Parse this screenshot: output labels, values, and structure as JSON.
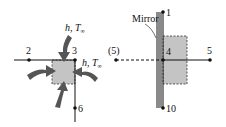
{
  "left_diagram": {
    "convection_top": {
      "h": "h",
      "sep": ", ",
      "T": "T",
      "sub": "∞"
    },
    "convection_right": {
      "h": "h",
      "sep": ", ",
      "T": "T",
      "sub": "∞"
    },
    "nodes": [
      {
        "id": "2",
        "label": "2"
      },
      {
        "id": "3",
        "label": "3"
      },
      {
        "id": "6",
        "label": "6"
      }
    ]
  },
  "right_diagram": {
    "mirror_label": "Mirror",
    "nodes": [
      {
        "id": "1",
        "label": "1"
      },
      {
        "id": "4",
        "label": "4"
      },
      {
        "id": "5",
        "label": "5"
      },
      {
        "id": "5_image",
        "label": "(5)"
      },
      {
        "id": "10",
        "label": "10"
      }
    ]
  },
  "colors": {
    "arrow": "#555555",
    "cell_fill": "#c4c4c4",
    "mirror": "#8a8a8a",
    "line": "#111111"
  }
}
